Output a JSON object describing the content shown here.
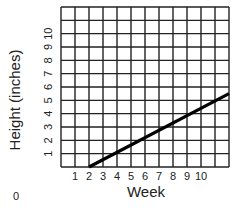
{
  "chart_data": {
    "type": "line",
    "title": "",
    "xlabel": "Week",
    "ylabel": "Height (inches)",
    "x_ticks": [
      "1",
      "2",
      "3",
      "4",
      "5",
      "6",
      "7",
      "8",
      "9",
      "10"
    ],
    "y_ticks": [
      "1",
      "2",
      "3",
      "4",
      "5",
      "6",
      "7",
      "8",
      "9",
      "10"
    ],
    "origin_label": "0",
    "xlim": [
      0,
      12
    ],
    "ylim": [
      0,
      12
    ],
    "grid": true,
    "legend": null,
    "series": [
      {
        "name": "Height",
        "color": "#000000",
        "x": [
          2,
          12
        ],
        "y": [
          0,
          5.5
        ]
      }
    ]
  },
  "colors": {
    "grid": "#222222",
    "line": "#000000",
    "background": "#ffffff"
  }
}
